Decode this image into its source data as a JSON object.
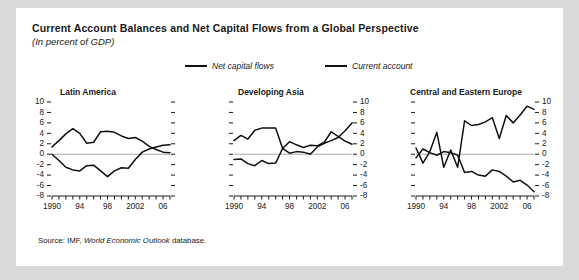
{
  "figure": {
    "title": "Current Account Balances and Net Capital Flows from a Global Perspective",
    "subtitle": "(In percent of GDP)",
    "source_prefix": "Source: IMF, ",
    "source_italic": "World Economic Outlook",
    "source_suffix": " database.",
    "background_color": "#d9d9d9",
    "card_color": "#ffffff",
    "line_color": "#111111",
    "zero_line_color": "#aaaaaa"
  },
  "legend": {
    "entries": [
      {
        "label": "Net capital flows",
        "color": "#111111"
      },
      {
        "label": "Current account",
        "color": "#111111"
      }
    ]
  },
  "chart_data": [
    {
      "type": "line",
      "title": "Latin America",
      "xlabel": "",
      "ylabel": "",
      "ylim": [
        -8,
        10
      ],
      "xlim": [
        1990,
        2007
      ],
      "yticks": [
        10,
        8,
        6,
        4,
        2,
        0,
        -2,
        -4,
        -6,
        -8
      ],
      "ytick_labels": [
        "10",
        "8",
        "6",
        "4",
        "2",
        "0",
        "-2",
        "-4",
        "-6",
        "-8"
      ],
      "xticks": [
        1990,
        1991,
        1992,
        1993,
        1994,
        1995,
        1996,
        1997,
        1998,
        1999,
        2000,
        2001,
        2002,
        2003,
        2004,
        2005,
        2006,
        2007
      ],
      "xtick_labels": [
        {
          "x": 1990,
          "label": "1990"
        },
        {
          "x": 1994,
          "label": "94"
        },
        {
          "x": 1998,
          "label": "98"
        },
        {
          "x": 2002,
          "label": "2002"
        },
        {
          "x": 2006,
          "label": "06"
        }
      ],
      "yaxis_labels_side": "left",
      "grid": false,
      "x": [
        1990,
        1991,
        1992,
        1993,
        1994,
        1995,
        1996,
        1997,
        1998,
        1999,
        2000,
        2001,
        2002,
        2003,
        2004,
        2005,
        2006,
        2007
      ],
      "series": [
        {
          "name": "Net capital flows",
          "values": [
            1.4,
            2.6,
            3.9,
            4.9,
            4.0,
            2.1,
            2.3,
            4.3,
            4.4,
            4.2,
            3.5,
            3.0,
            3.2,
            2.5,
            1.5,
            0.9,
            0.4,
            0.3
          ]
        },
        {
          "name": "Current account",
          "values": [
            0.0,
            -1.2,
            -2.5,
            -3.0,
            -3.2,
            -2.2,
            -2.1,
            -3.2,
            -4.3,
            -3.2,
            -2.6,
            -2.7,
            -1.0,
            0.4,
            1.0,
            1.4,
            1.7,
            1.8
          ]
        }
      ]
    },
    {
      "type": "line",
      "title": "Developing Asia",
      "xlabel": "",
      "ylabel": "",
      "ylim": [
        -8,
        10
      ],
      "xlim": [
        1990,
        2007
      ],
      "yticks": [
        10,
        8,
        6,
        4,
        2,
        0,
        -2,
        -4,
        -6,
        -8
      ],
      "ytick_labels": [
        "10",
        "8",
        "6",
        "4",
        "2",
        "0",
        "-2",
        "-4",
        "-6",
        "-8"
      ],
      "xticks": [
        1990,
        1991,
        1992,
        1993,
        1994,
        1995,
        1996,
        1997,
        1998,
        1999,
        2000,
        2001,
        2002,
        2003,
        2004,
        2005,
        2006,
        2007
      ],
      "xtick_labels": [
        {
          "x": 1990,
          "label": "1990"
        },
        {
          "x": 1994,
          "label": "94"
        },
        {
          "x": 1998,
          "label": "98"
        },
        {
          "x": 2002,
          "label": "2002"
        },
        {
          "x": 2006,
          "label": "06"
        }
      ],
      "yaxis_labels_side": "right",
      "grid": false,
      "x": [
        1990,
        1991,
        1992,
        1993,
        1994,
        1995,
        1996,
        1997,
        1998,
        1999,
        2000,
        2001,
        2002,
        2003,
        2004,
        2005,
        2006,
        2007
      ],
      "series": [
        {
          "name": "Net capital flows",
          "values": [
            2.6,
            3.6,
            2.9,
            4.6,
            5.0,
            5.0,
            5.0,
            1.1,
            2.4,
            1.8,
            1.3,
            1.7,
            1.6,
            2.3,
            4.3,
            3.4,
            2.5,
            1.9
          ]
        },
        {
          "name": "Current account",
          "values": [
            -1.0,
            -0.9,
            -1.8,
            -2.2,
            -1.2,
            -1.8,
            -1.7,
            1.1,
            0.2,
            0.5,
            0.4,
            0.0,
            1.4,
            2.1,
            2.6,
            3.2,
            4.5,
            6.0
          ]
        }
      ]
    },
    {
      "type": "line",
      "title": "Central and Eastern Europe",
      "xlabel": "",
      "ylabel": "",
      "ylim": [
        -8,
        10
      ],
      "xlim": [
        1990,
        2007
      ],
      "yticks": [
        10,
        8,
        6,
        4,
        2,
        0,
        -2,
        -4,
        -6,
        -8
      ],
      "ytick_labels": [
        "10",
        "8",
        "6",
        "4",
        "2",
        "0",
        "-2",
        "-4",
        "-6",
        "-8"
      ],
      "xticks": [
        1990,
        1991,
        1992,
        1993,
        1994,
        1995,
        1996,
        1997,
        1998,
        1999,
        2000,
        2001,
        2002,
        2003,
        2004,
        2005,
        2006,
        2007
      ],
      "xtick_labels": [
        {
          "x": 1990,
          "label": "1990"
        },
        {
          "x": 1994,
          "label": "94"
        },
        {
          "x": 1998,
          "label": "98"
        },
        {
          "x": 2002,
          "label": "2002"
        },
        {
          "x": 2006,
          "label": "06"
        }
      ],
      "yaxis_labels_side": "right",
      "grid": false,
      "x": [
        1990,
        1991,
        1992,
        1993,
        1994,
        1995,
        1996,
        1997,
        1998,
        1999,
        2000,
        2001,
        2002,
        2003,
        2004,
        2005,
        2006,
        2007
      ],
      "series": [
        {
          "name": "Net capital flows",
          "values": [
            1.2,
            -1.7,
            0.5,
            4.2,
            -2.5,
            0.8,
            -2.5,
            6.4,
            5.5,
            5.7,
            6.2,
            7.0,
            3.0,
            7.4,
            6.0,
            7.5,
            9.2,
            8.6
          ]
        },
        {
          "name": "Current account",
          "values": [
            -0.7,
            1.0,
            0.3,
            -0.2,
            0.5,
            0.3,
            -0.2,
            -3.5,
            -3.3,
            -4.0,
            -4.2,
            -3.0,
            -3.3,
            -4.2,
            -5.3,
            -5.0,
            -5.9,
            -7.2
          ]
        }
      ]
    }
  ]
}
